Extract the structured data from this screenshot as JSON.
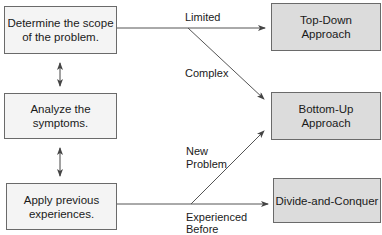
{
  "diagram": {
    "steps": [
      {
        "id": "scope",
        "label": "Determine the scope of the problem."
      },
      {
        "id": "symptoms",
        "label": "Analyze the symptoms."
      },
      {
        "id": "experience",
        "label": "Apply previous experiences."
      }
    ],
    "approaches": [
      {
        "id": "top-down",
        "label": "Top-Down Approach"
      },
      {
        "id": "bottom-up",
        "label": "Bottom-Up Approach"
      },
      {
        "id": "divide",
        "label": "Divide-and-Conquer"
      }
    ],
    "edges": [
      {
        "from": "scope",
        "to": "top-down",
        "label": "Limited"
      },
      {
        "from": "scope",
        "to": "bottom-up",
        "label": "Complex"
      },
      {
        "from": "experience",
        "to": "bottom-up",
        "label": "New Problem"
      },
      {
        "from": "experience",
        "to": "divide",
        "label": "Experienced Before"
      },
      {
        "from": "scope",
        "to": "symptoms",
        "label": "",
        "bidirectional": true
      },
      {
        "from": "symptoms",
        "to": "experience",
        "label": "",
        "bidirectional": true
      }
    ],
    "edge_labels": {
      "limited": "Limited",
      "complex": "Complex",
      "new_problem_1": "New",
      "new_problem_2": "Problem",
      "experienced_1": "Experienced",
      "experienced_2": "Before"
    },
    "box_text": {
      "scope_1": "Determine the scope",
      "scope_2": "of the problem.",
      "symptoms_1": "Analyze the",
      "symptoms_2": "symptoms.",
      "experience_1": "Apply previous",
      "experience_2": "experiences.",
      "topdown_1": "Top-Down",
      "topdown_2": "Approach",
      "bottomup_1": "Bottom-Up",
      "bottomup_2": "Approach",
      "divide_1": "Divide-and-Conquer"
    },
    "colors": {
      "left_box_fill": "#f4f4f4",
      "right_box_fill": "#dcdcdc",
      "border": "#6a6a6a",
      "line": "#555555"
    }
  }
}
